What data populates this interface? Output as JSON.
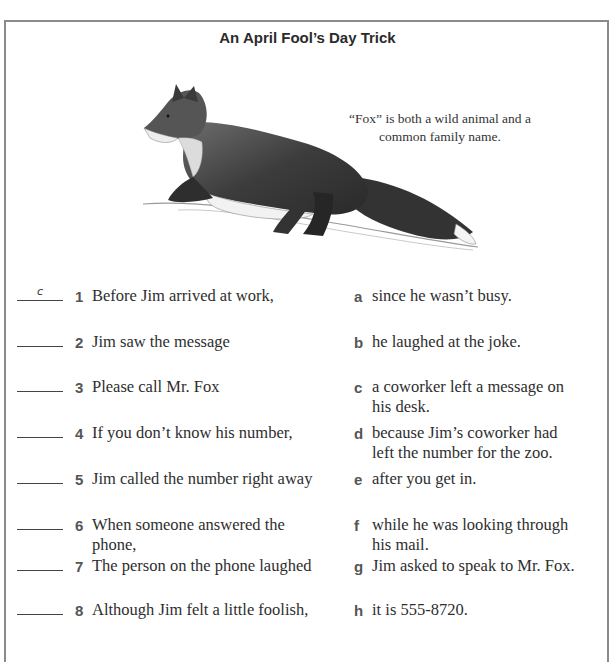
{
  "worksheet": {
    "title": "An April Fool’s Day Trick",
    "illustration": {
      "icon": "fox-drawing",
      "caption_line1": "“Fox” is both a wild animal and a",
      "caption_line2": "common family name."
    },
    "left_column": [
      {
        "answer": "c",
        "number": "1",
        "text": "Before Jim arrived at work,"
      },
      {
        "answer": "",
        "number": "2",
        "text": "Jim saw the message"
      },
      {
        "answer": "",
        "number": "3",
        "text": "Please call Mr. Fox"
      },
      {
        "answer": "",
        "number": "4",
        "text": "If you don’t know his number,"
      },
      {
        "answer": "",
        "number": "5",
        "text": "Jim called the number right away"
      },
      {
        "answer": "",
        "number": "6",
        "text_line1": "When someone answered the",
        "text_line2": "phone,"
      },
      {
        "answer": "",
        "number": "7",
        "text": "The person on the phone laughed"
      },
      {
        "answer": "",
        "number": "8",
        "text": "Although Jim felt a little foolish,"
      }
    ],
    "right_column": [
      {
        "letter": "a",
        "text": "since he wasn’t busy."
      },
      {
        "letter": "b",
        "text": "he laughed at the joke."
      },
      {
        "letter": "c",
        "text_line1": "a coworker left a message on",
        "text_line2": "his desk."
      },
      {
        "letter": "d",
        "text_line1": "because Jim’s coworker had",
        "text_line2": "left the number for the zoo."
      },
      {
        "letter": "e",
        "text": "after you get in."
      },
      {
        "letter": "f",
        "text_line1": "while he was looking through",
        "text_line2": "his mail."
      },
      {
        "letter": "g",
        "text": "Jim asked to speak to Mr. Fox."
      },
      {
        "letter": "h",
        "text": "it is 555-8720."
      }
    ]
  }
}
